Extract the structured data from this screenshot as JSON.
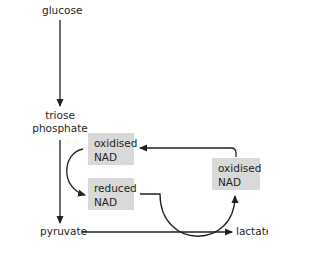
{
  "diagram": {
    "title": "",
    "nodes": {
      "glucose": "glucose",
      "triose_line1": "triose",
      "triose_line2": "phosphate",
      "pyruvate": "pyruvate",
      "lactate": "lactate",
      "oxidised_nad_left_line1": "oxidised",
      "oxidised_nad_left_line2": "NAD",
      "reduced_nad_line1": "reduced",
      "reduced_nad_line2": "NAD",
      "oxidised_nad_right_line1": "oxidised",
      "oxidised_nad_right_line2": "NAD"
    },
    "edges": [
      {
        "from": "glucose",
        "to": "triose phosphate"
      },
      {
        "from": "triose phosphate",
        "to": "pyruvate"
      },
      {
        "from": "oxidised NAD (left)",
        "to": "reduced NAD"
      },
      {
        "from": "pyruvate",
        "to": "lactate"
      },
      {
        "from": "reduced NAD",
        "to": "oxidised NAD (right)"
      },
      {
        "from": "oxidised NAD (right)",
        "to": "oxidised NAD (left)"
      }
    ],
    "colors": {
      "box_fill": "#d9d9d9",
      "line": "#231f20"
    }
  }
}
